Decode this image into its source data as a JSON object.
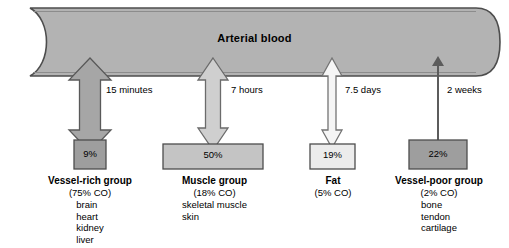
{
  "vessel": {
    "title": "Arterial blood",
    "fill": "#b3b3b3",
    "stroke": "#4d4d4d"
  },
  "diagram": {
    "type": "flow-diagram",
    "background": "#ffffff"
  },
  "compartments": [
    {
      "id": "vessel-rich",
      "time_label": "15 minutes",
      "percent": "9%",
      "name": "Vessel-rich group",
      "cardiac_output": "(75% CO)",
      "tissues": [
        "brain",
        "heart",
        "kidney",
        "liver"
      ],
      "arrow_style": "wide-double-headed",
      "arrow_fill": "#a6a6a6",
      "box_fill": "#9e9e9e"
    },
    {
      "id": "muscle",
      "time_label": "7 hours",
      "percent": "50%",
      "name": "Muscle group",
      "cardiac_output": "(18% CO)",
      "tissues": [
        "skeletal muscle",
        "skin"
      ],
      "arrow_style": "medium-double-headed",
      "arrow_fill": "#cccccc",
      "box_fill": "#c4c4c4"
    },
    {
      "id": "fat",
      "time_label": "7.5 days",
      "percent": "19%",
      "name": "Fat",
      "cardiac_output": "(5% CO)",
      "tissues": [],
      "arrow_style": "narrow-double-headed",
      "arrow_fill": "#f2f2f2",
      "box_fill": "#e8e8e8"
    },
    {
      "id": "vessel-poor",
      "time_label": "2 weeks",
      "percent": "22%",
      "name": "Vessel-poor group",
      "cardiac_output": "(2% CO)",
      "tissues": [
        "bone",
        "tendon",
        "cartilage"
      ],
      "arrow_style": "thin-line-double-headed",
      "arrow_fill": "#808080",
      "box_fill": "#9e9e9e"
    }
  ]
}
